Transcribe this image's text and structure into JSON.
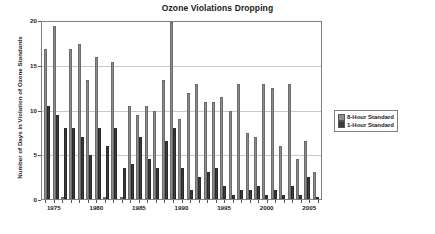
{
  "chart_data": {
    "type": "bar",
    "title": "Ozone Violations Dropping",
    "xlabel": "",
    "ylabel": "Number of Days in Violation of Ozone Standards",
    "ylim": [
      0,
      20
    ],
    "ytick_labels": [
      "0",
      "5",
      "10",
      "15",
      "20"
    ],
    "ytick_values": [
      0,
      5,
      10,
      15,
      20
    ],
    "grid": true,
    "legend_position": "right",
    "xtick_labels": [
      "1975",
      "1980",
      "1985",
      "1990",
      "1995",
      "2000",
      "2005"
    ],
    "xtick_years": [
      1975,
      1980,
      1985,
      1990,
      1995,
      2000,
      2005
    ],
    "categories": [
      "1974",
      "1975",
      "1976",
      "1977",
      "1978",
      "1979",
      "1980",
      "1981",
      "1982",
      "1983",
      "1984",
      "1985",
      "1986",
      "1987",
      "1988",
      "1989",
      "1990",
      "1991",
      "1992",
      "1993",
      "1994",
      "1995",
      "1996",
      "1997",
      "1998",
      "1999",
      "2000",
      "2001",
      "2002",
      "2003",
      "2004",
      "2005",
      "2006"
    ],
    "series": [
      {
        "name": "8-Hour Standard",
        "color": "#8c8c8c",
        "values": [
          17,
          19.5,
          0,
          17,
          17.5,
          13.5,
          16,
          0,
          15.5,
          0,
          10.5,
          9.5,
          10.5,
          10,
          13.5,
          20,
          9,
          12,
          13,
          11,
          11,
          11.5,
          10,
          13,
          7.5,
          7,
          13,
          12.5,
          6,
          13,
          4.5,
          6.5,
          3
        ]
      },
      {
        "name": "1-Hour Standard",
        "color": "#3a3a3a",
        "values": [
          10.5,
          9.5,
          8,
          8,
          7,
          5,
          8,
          6,
          8,
          3.5,
          4,
          7,
          4.5,
          3.5,
          6.5,
          8,
          3.5,
          1,
          2.5,
          3,
          3.5,
          1.5,
          0.5,
          1,
          1,
          1.5,
          0.5,
          1,
          0.5,
          1.5,
          0.5,
          2.5,
          0
        ]
      }
    ]
  },
  "legend": {
    "items": [
      {
        "label": "8-Hour Standard"
      },
      {
        "label": "1-Hour Standard"
      }
    ]
  }
}
